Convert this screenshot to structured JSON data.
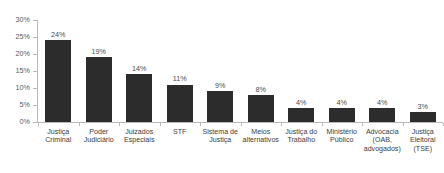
{
  "chart_data": {
    "type": "bar",
    "title": "",
    "subtitle": "",
    "xlabel": "",
    "ylabel": "",
    "ylim": [
      0,
      30
    ],
    "y_tick_labels": [
      "30%",
      "25%",
      "20%",
      "15%",
      "10%",
      "5%",
      "0%"
    ],
    "y_tick_values": [
      30,
      25,
      20,
      15,
      10,
      5,
      0
    ],
    "grid": false,
    "legend": false,
    "legend_position": "none",
    "bar_color": "#2c2c2c",
    "axis_color": "#b9b9b9",
    "categories": [
      "Justiça Criminal",
      "Poder Judiciário",
      "Juizados Especiais",
      "STF",
      "Sistema de Justiça",
      "Meios alternativos",
      "Justiça do Trabalho",
      "Ministério Público",
      "Advocacia (OAB, advogados)",
      "Justiça Eleitoral (TSE)"
    ],
    "values": [
      24,
      19,
      14,
      11,
      9,
      8,
      4,
      4,
      4,
      3
    ],
    "value_labels": [
      "24%",
      "19%",
      "14%",
      "11%",
      "9%",
      "8%",
      "4%",
      "4%",
      "4%",
      "3%"
    ]
  }
}
